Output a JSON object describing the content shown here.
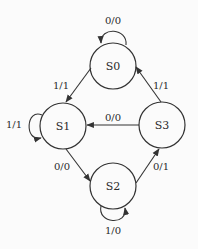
{
  "diagram": {
    "type": "state-transition-diagram",
    "colors": {
      "background": "#fbfbfb",
      "stroke": "#333333",
      "text": "#2a2a2a"
    },
    "states": [
      {
        "id": "S0",
        "label": "S0",
        "cx": 113,
        "cy": 66,
        "r": 23
      },
      {
        "id": "S1",
        "label": "S1",
        "cx": 63,
        "cy": 126,
        "r": 23
      },
      {
        "id": "S2",
        "label": "S2",
        "cx": 113,
        "cy": 186,
        "r": 23
      },
      {
        "id": "S3",
        "label": "S3",
        "cx": 162,
        "cy": 125,
        "r": 23
      }
    ],
    "transitions": [
      {
        "from": "S0",
        "to": "S0",
        "label": "0/0",
        "kind": "self-loop-top"
      },
      {
        "from": "S0",
        "to": "S1",
        "label": "1/1"
      },
      {
        "from": "S1",
        "to": "S1",
        "label": "1/1",
        "kind": "self-loop-left"
      },
      {
        "from": "S1",
        "to": "S2",
        "label": "0/0"
      },
      {
        "from": "S2",
        "to": "S2",
        "label": "1/0",
        "kind": "self-loop-bottom"
      },
      {
        "from": "S2",
        "to": "S3",
        "label": "0/1"
      },
      {
        "from": "S3",
        "to": "S0",
        "label": "1/1"
      },
      {
        "from": "S3",
        "to": "S1",
        "label": "0/0"
      }
    ]
  }
}
